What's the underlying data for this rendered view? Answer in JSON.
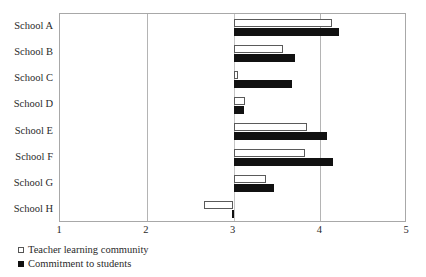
{
  "chart_data": {
    "type": "bar",
    "orientation": "horizontal",
    "title": "",
    "subtitle": "",
    "xlabel": "",
    "ylabel": "",
    "xlim": [
      1,
      5
    ],
    "xticks": [
      "1",
      "2",
      "3",
      "4",
      "5"
    ],
    "baseline": 3,
    "grid": "vertical gridlines at x = 2, 3, 4",
    "legend_position": "below-left",
    "categories": [
      "School A",
      "School B",
      "School C",
      "School D",
      "School E",
      "School F",
      "School G",
      "School H"
    ],
    "series": [
      {
        "name": "Teacher learning community",
        "style": "open",
        "color": "#ffffff",
        "edge_color": "#5a5a5a",
        "values": [
          4.13,
          3.57,
          3.05,
          3.13,
          3.85,
          3.82,
          3.38,
          2.66
        ]
      },
      {
        "name": "Commitment to students",
        "style": "solid",
        "color": "#111111",
        "edge_color": "#111111",
        "values": [
          4.22,
          3.71,
          3.67,
          3.12,
          4.08,
          4.15,
          3.47,
          2.98
        ]
      }
    ]
  },
  "legend": {
    "items": [
      {
        "label": "Teacher learning community",
        "swatch": "open-square"
      },
      {
        "label": "Commitment to students",
        "swatch": "filled-square"
      }
    ]
  }
}
